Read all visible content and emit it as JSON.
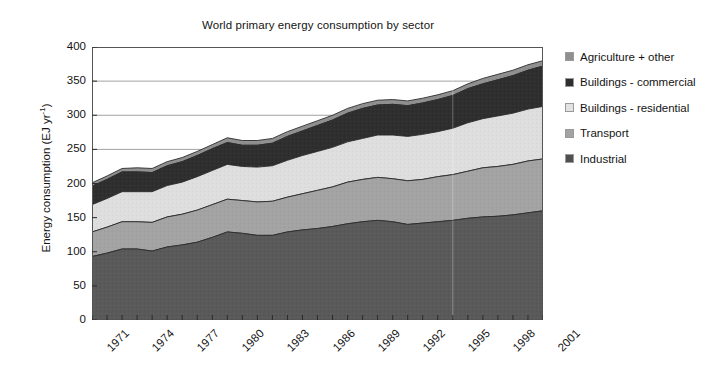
{
  "chart_data": {
    "type": "area",
    "title": "World primary energy consumption by sector",
    "xlabel": "",
    "ylabel": "Energy consumption (EJ yr",
    "ylabel_sup": "-1",
    "ylabel_tail": ")",
    "ylim": [
      0,
      400
    ],
    "xlim": [
      1971,
      2001
    ],
    "grid": true,
    "stacked": true,
    "legend_position": "right",
    "ytick_labels": [
      "400",
      "350",
      "300",
      "250",
      "200",
      "150",
      "100",
      "50",
      "0"
    ],
    "ytick_values": [
      400,
      350,
      300,
      250,
      200,
      150,
      100,
      50,
      0
    ],
    "xtick_labels": [
      "1971",
      "1974",
      "1977",
      "1980",
      "1983",
      "1986",
      "1989",
      "1992",
      "1995",
      "1998",
      "2001"
    ],
    "xtick_values": [
      1971,
      1974,
      1977,
      1980,
      1983,
      1986,
      1989,
      1992,
      1995,
      1998,
      2001
    ],
    "x": [
      1971,
      1972,
      1973,
      1974,
      1975,
      1976,
      1977,
      1978,
      1979,
      1980,
      1981,
      1982,
      1983,
      1984,
      1985,
      1986,
      1987,
      1988,
      1989,
      1990,
      1991,
      1992,
      1993,
      1994,
      1995,
      1996,
      1997,
      1998,
      1999,
      2000,
      2001
    ],
    "series": [
      {
        "name": "Industrial",
        "color": "#595959",
        "values": [
          93,
          98,
          104,
          104,
          101,
          107,
          110,
          114,
          121,
          129,
          127,
          124,
          124,
          129,
          132,
          134,
          137,
          141,
          144,
          146,
          144,
          140,
          142,
          144,
          146,
          149,
          151,
          152,
          154,
          157,
          160
        ]
      },
      {
        "name": "Transport",
        "color": "#a3a3a3",
        "values": [
          36,
          38,
          40,
          40,
          42,
          44,
          45,
          47,
          48,
          48,
          48,
          49,
          50,
          51,
          53,
          56,
          58,
          61,
          62,
          63,
          63,
          64,
          64,
          66,
          67,
          69,
          72,
          73,
          74,
          76,
          76
        ]
      },
      {
        "name": "Buildings - residential",
        "color": "#dedede",
        "values": [
          40,
          42,
          44,
          44,
          45,
          46,
          47,
          49,
          50,
          51,
          50,
          51,
          52,
          54,
          56,
          57,
          58,
          59,
          60,
          62,
          64,
          65,
          66,
          66,
          68,
          71,
          72,
          74,
          75,
          76,
          77
        ]
      },
      {
        "name": "Buildings - commercial",
        "color": "#2e2e2e",
        "values": [
          27,
          28,
          29,
          29,
          28,
          29,
          30,
          31,
          32,
          32,
          31,
          32,
          33,
          35,
          36,
          38,
          40,
          42,
          44,
          44,
          45,
          45,
          46,
          47,
          48,
          50,
          51,
          53,
          55,
          57,
          59
        ]
      },
      {
        "name": "Agriculture + other",
        "color": "#8f8f8f",
        "values": [
          5,
          5,
          5,
          6,
          6,
          6,
          6,
          6,
          6,
          7,
          7,
          7,
          7,
          7,
          7,
          7,
          7,
          7,
          7,
          7,
          7,
          7,
          7,
          7,
          7,
          7,
          8,
          8,
          8,
          8,
          8
        ]
      }
    ]
  },
  "legend": {
    "items": [
      {
        "label": "Agriculture + other",
        "color": "#8f8f8f"
      },
      {
        "label": "Buildings - commercial",
        "color": "#2e2e2e"
      },
      {
        "label": "Buildings - residential",
        "color": "#e2e2e2"
      },
      {
        "label": "Transport",
        "color": "#a3a3a3"
      },
      {
        "label": "Industrial",
        "color": "#4f4f4f"
      }
    ]
  }
}
